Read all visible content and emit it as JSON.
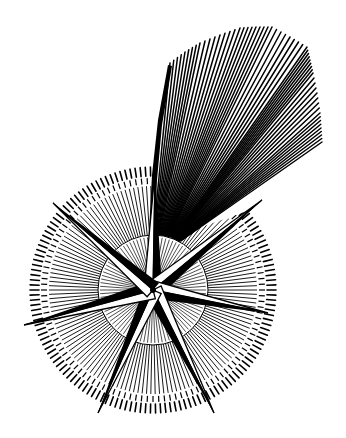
{
  "image": {
    "subject": "Engraving of a comet depicted as an eight-pointed star with a radiating tail",
    "style": "black and white woodcut/engraving",
    "colors": {
      "ink": "#000000",
      "paper": "#ffffff"
    },
    "star": {
      "center": [
        153,
        290
      ],
      "points": 7
    },
    "halo": {
      "outer_radius": 123,
      "inner_radius": 104
    },
    "tail": {
      "direction": "up-right"
    }
  }
}
